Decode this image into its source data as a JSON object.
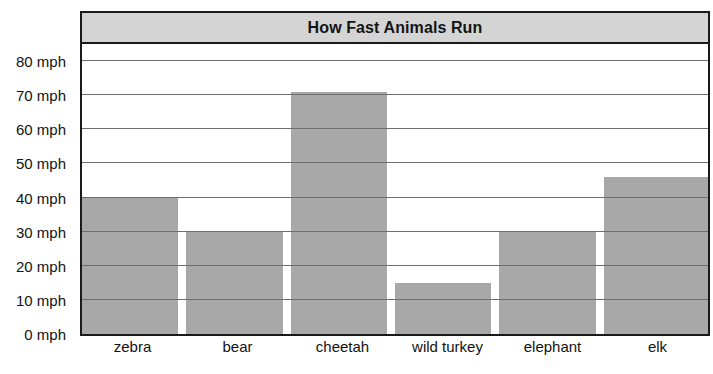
{
  "chart_data": {
    "type": "bar",
    "title": "How Fast Animals Run",
    "xlabel": "",
    "ylabel": "",
    "categories": [
      "zebra",
      "bear",
      "cheetah",
      "wild turkey",
      "elephant",
      "elk"
    ],
    "values": [
      40,
      30,
      71,
      15,
      30,
      46
    ],
    "unit": "mph",
    "ylim": [
      0,
      85
    ],
    "y_ticks": [
      0,
      10,
      20,
      30,
      40,
      50,
      60,
      70,
      80
    ],
    "y_tick_labels": [
      "0 mph",
      "10 mph",
      "20 mph",
      "30 mph",
      "40 mph",
      "50 mph",
      "60 mph",
      "70 mph",
      "80 mph"
    ],
    "grid": true,
    "legend": false,
    "legend_position": "none",
    "bar_color": "#a8a8a8",
    "title_bar_color": "#d4d4d4",
    "border_color": "#1a1a1a",
    "gridline_color": "#6e6e6e",
    "text_color": "#121212"
  }
}
